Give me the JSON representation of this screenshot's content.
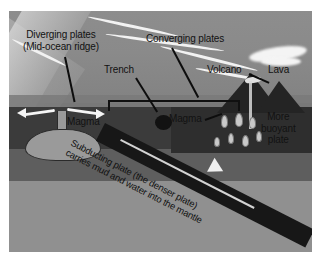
{
  "figure": {
    "background_color": "#ffffff",
    "canvas_color": "#6f6f6f"
  },
  "labels": {
    "diverging_line1": "Diverging plates",
    "diverging_line2": "(Mid-ocean ridge)",
    "converging": "Converging plates",
    "trench": "Trench",
    "volcano": "Volcano",
    "lava": "Lava",
    "magma_left": "Magma",
    "magma_right": "Magma",
    "buoyant_line1": "More",
    "buoyant_line2": "buoyant",
    "buoyant_line3": "plate",
    "subducting_line1": "Subducting plate (the denser plate)",
    "subducting_line2": "carries mud and water into the mantle"
  },
  "icons": {
    "spreading_arrow_left": "arrow-left-icon",
    "spreading_arrow_right": "arrow-right-icon",
    "subduction_arrow": "arrow-down-right-icon"
  },
  "colors": {
    "sky": "#8a8a8a",
    "ocean": "#7a7a7a",
    "crust": "#3b3b3b",
    "mantle": "#6c6c6c",
    "lower_mantle": "#909090",
    "slab": "#171717",
    "magma": "#9a9a9a",
    "label_text": "#121212",
    "arrow": "#f5f5f5"
  }
}
